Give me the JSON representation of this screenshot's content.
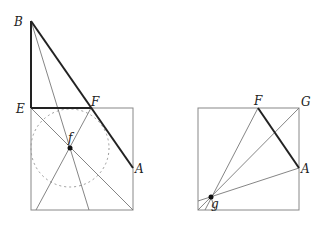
{
  "figures": {
    "left": {
      "labels": {
        "B": "B",
        "E": "E",
        "F": "F",
        "A": "A",
        "f": "f"
      }
    },
    "right": {
      "labels": {
        "F": "F",
        "G": "G",
        "A": "A",
        "g": "g"
      }
    }
  },
  "colors": {
    "thin": "#777777",
    "thick": "#222222",
    "dotted": "#999999"
  }
}
